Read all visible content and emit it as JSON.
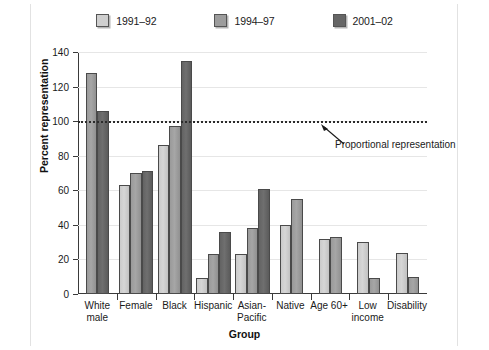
{
  "chart_data": {
    "type": "bar",
    "title": "",
    "xlabel": "Group",
    "ylabel": "Percent representation",
    "ylim": [
      0,
      140
    ],
    "yticks": [
      0,
      20,
      40,
      60,
      80,
      100,
      120,
      140
    ],
    "grid": true,
    "legend_position": "top-center",
    "categories": [
      "White male",
      "Female",
      "Black",
      "Hispanic",
      "Asian-Pacific",
      "Native",
      "Age 60+",
      "Low income",
      "Disability"
    ],
    "category_lines": [
      [
        "White",
        "male"
      ],
      [
        "Female"
      ],
      [
        "Black"
      ],
      [
        "Hispanic"
      ],
      [
        "Asian-",
        "Pacific"
      ],
      [
        "Native"
      ],
      [
        "Age 60+"
      ],
      [
        "Low",
        "income"
      ],
      [
        "Disability"
      ]
    ],
    "series": [
      {
        "name": "1991–92",
        "color": "#cccccc",
        "values": [
          null,
          63,
          86,
          9,
          23,
          40,
          32,
          30,
          24
        ]
      },
      {
        "name": "1994–97",
        "color": "#999999",
        "values": [
          128,
          70,
          97,
          23,
          38,
          55,
          33,
          9,
          10
        ]
      },
      {
        "name": "2001–02",
        "color": "#666666",
        "values": [
          106,
          71,
          135,
          36,
          61,
          null,
          null,
          null,
          null
        ]
      }
    ],
    "annotations": [
      {
        "text": "Proportional representation",
        "value": 100,
        "kind": "reference-line",
        "line_style": "dotted"
      }
    ]
  },
  "legend": {
    "items": [
      {
        "label": "1991–92",
        "color": "#cccccc"
      },
      {
        "label": "1994–97",
        "color": "#999999"
      },
      {
        "label": "2001–02",
        "color": "#666666"
      }
    ]
  },
  "axes": {
    "y_title": "Percent representation",
    "x_title": "Group",
    "y_tick_labels": [
      "0",
      "20",
      "40",
      "60",
      "80",
      "100",
      "120",
      "140"
    ]
  },
  "annotation": {
    "label": "Proportional representation"
  }
}
